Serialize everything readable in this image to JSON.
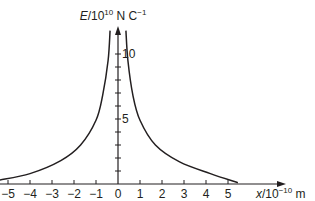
{
  "chart_data": {
    "type": "line",
    "title": "",
    "xlabel": "x/10^-10 m",
    "ylabel": "E/10^10 N C^-1",
    "xlabel_parts": {
      "var": "x",
      "rest": "/10",
      "exp": "−10",
      "unit": " m"
    },
    "ylabel_parts": {
      "var": "E",
      "rest": "/10",
      "exp": "10",
      "unit": " N C",
      "unit_exp": "−1"
    },
    "x_ticks": [
      -5,
      -4,
      -3,
      -2,
      -1,
      0,
      1,
      2,
      3,
      4,
      5
    ],
    "x_tick_labels": [
      "−5",
      "−4",
      "−3",
      "−2",
      "−1",
      "0",
      "1",
      "2",
      "3",
      "4",
      "5"
    ],
    "y_labeled_ticks": [
      5,
      10
    ],
    "y_tick_labels": [
      "5",
      "10"
    ],
    "y_minor_ticks": [
      1,
      2,
      3,
      4,
      5,
      6,
      7,
      8,
      9,
      10
    ],
    "xlim": [
      -5.4,
      7.5
    ],
    "ylim": [
      0,
      12
    ],
    "grid": false,
    "legend": null,
    "series": [
      {
        "name": "E (x < 0)",
        "points": [
          [
            -5.4,
            0.3
          ],
          [
            -4.0,
            0.8
          ],
          [
            -2.6,
            1.8
          ],
          [
            -1.7,
            3.0
          ],
          [
            -1.0,
            4.9
          ],
          [
            -0.7,
            6.8
          ],
          [
            -0.45,
            9.5
          ],
          [
            -0.36,
            11.8
          ]
        ]
      },
      {
        "name": "E (x > 0)",
        "points": [
          [
            0.36,
            11.8
          ],
          [
            0.45,
            9.5
          ],
          [
            0.68,
            6.8
          ],
          [
            1.0,
            4.9
          ],
          [
            1.7,
            3.0
          ],
          [
            2.8,
            1.7
          ],
          [
            4.2,
            0.8
          ],
          [
            5.45,
            0.1
          ]
        ]
      }
    ],
    "colors": {
      "ink": "#231f20",
      "background": "#ffffff"
    }
  }
}
